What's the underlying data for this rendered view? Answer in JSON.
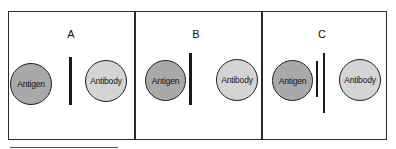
{
  "panels": [
    {
      "label": "A",
      "antigen": "Antigen",
      "antibody": "Antibody",
      "description": "single thick line between antigen and antibody"
    },
    {
      "label": "B",
      "antigen": "Antigen",
      "antibody": "Antibody",
      "description": "single thick line closer to antigen"
    },
    {
      "label": "C",
      "antigen": "Antigen",
      "antibody": "Antibody",
      "description": "thin short line plus thick long line between antigen and antibody"
    }
  ],
  "colors": {
    "antigen_fill": "#a9a9a9",
    "antibody_fill": "#d4d4d4",
    "line": "#1a1a1a",
    "border": "#2a2a2a"
  }
}
